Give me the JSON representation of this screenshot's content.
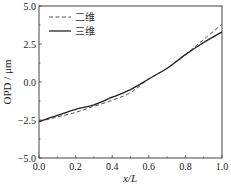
{
  "chart_data": {
    "type": "line",
    "title": "",
    "xlabel": "x/L",
    "ylabel": "OPD / μm",
    "xlim": [
      0.0,
      1.0
    ],
    "ylim": [
      -5.0,
      5.0
    ],
    "xticks": [
      "0.0",
      "0.2",
      "0.4",
      "0.6",
      "0.8",
      "1.0"
    ],
    "yticks": [
      "-5.0",
      "-2.5",
      "0.0",
      "2.5",
      "5.0"
    ],
    "grid": false,
    "legend_position": "top-left",
    "x": [
      0.0,
      0.1,
      0.2,
      0.3,
      0.4,
      0.5,
      0.6,
      0.7,
      0.8,
      0.9,
      1.0
    ],
    "series": [
      {
        "name": "二维",
        "style": "dashed",
        "color": "#555555",
        "values": [
          -2.6,
          -2.3,
          -2.0,
          -1.6,
          -1.2,
          -0.7,
          0.2,
          0.9,
          1.8,
          2.8,
          3.8
        ]
      },
      {
        "name": "三维",
        "style": "solid",
        "color": "#222222",
        "values": [
          -2.6,
          -2.2,
          -1.8,
          -1.5,
          -1.0,
          -0.5,
          0.2,
          0.9,
          1.8,
          2.6,
          3.3
        ]
      }
    ]
  }
}
